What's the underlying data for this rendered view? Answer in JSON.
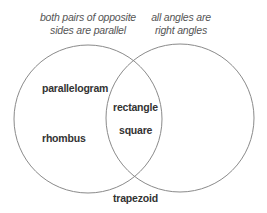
{
  "diagram": {
    "type": "venn",
    "sets": [
      {
        "id": "left",
        "caption_lines": [
          "both pairs of opposite",
          "sides are parallel"
        ],
        "circle": {
          "cx": 88,
          "cy": 119,
          "r": 74
        }
      },
      {
        "id": "right",
        "caption_lines": [
          "all angles are",
          "right angles"
        ],
        "circle": {
          "cx": 180,
          "cy": 118,
          "r": 74
        }
      }
    ],
    "regions": {
      "left_only": [
        "parallelogram",
        "rhombus"
      ],
      "intersection": [
        "rectangle",
        "square"
      ],
      "outside": [
        "trapezoid"
      ]
    },
    "labels": {
      "parallelogram": "parallelogram",
      "rhombus": "rhombus",
      "rectangle": "rectangle",
      "square": "square",
      "trapezoid": "trapezoid"
    },
    "colors": {
      "stroke": "#8a8a8a",
      "caption_text": "#555555",
      "label_text": "#333333",
      "background": "#ffffff"
    }
  }
}
